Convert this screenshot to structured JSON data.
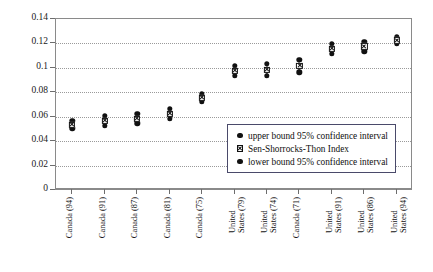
{
  "chart_data": {
    "type": "scatter",
    "title": "",
    "xlabel": "",
    "ylabel": "",
    "ylim": [
      0,
      0.14
    ],
    "y_ticks": [
      "0",
      "0.02",
      "0.04",
      "0.06",
      "0.08",
      "0.1",
      "0.12",
      "0.14"
    ],
    "y_tick_values": [
      0,
      0.02,
      0.04,
      0.06,
      0.08,
      0.1,
      0.12,
      0.14
    ],
    "grid": true,
    "legend_position": "inside-center-right",
    "categories": [
      "Canada (94)",
      "Canada (91)",
      "Canada (87)",
      "Canada (81)",
      "Canada (75)",
      "United States (79)",
      "United States (74)",
      "Canada (71)",
      "United States (91)",
      "United States (86)",
      "United States (94)"
    ],
    "series": [
      {
        "name": "upper bound 95% confidence interval",
        "marker": "circle",
        "values": [
          0.0565,
          0.0605,
          0.0625,
          0.0665,
          0.0785,
          0.1015,
          0.1035,
          0.1065,
          0.1195,
          0.1215,
          0.1255
        ]
      },
      {
        "name": "Sen-Shorrocks-Thon Index",
        "marker": "square-x",
        "values": [
          0.0535,
          0.0565,
          0.0585,
          0.0625,
          0.0755,
          0.0975,
          0.0985,
          0.1015,
          0.1155,
          0.1175,
          0.1225
        ]
      },
      {
        "name": "lower bound 95% confidence interval",
        "marker": "circle",
        "values": [
          0.0505,
          0.0525,
          0.0545,
          0.0585,
          0.0725,
          0.0935,
          0.0935,
          0.0965,
          0.1115,
          0.1135,
          0.1195
        ]
      }
    ]
  },
  "legend": {
    "items": [
      {
        "label": "upper bound 95% confidence interval",
        "marker": "circle"
      },
      {
        "label": "Sen-Shorrocks-Thon Index",
        "marker": "square-x"
      },
      {
        "label": "lower bound 95% confidence interval",
        "marker": "circle"
      }
    ]
  },
  "colors": {
    "marker": "#111111",
    "grid": "#9a9a9a",
    "axis": "#8a8a8a",
    "legend_border": "#4a4a6a",
    "background": "#ffffff"
  }
}
